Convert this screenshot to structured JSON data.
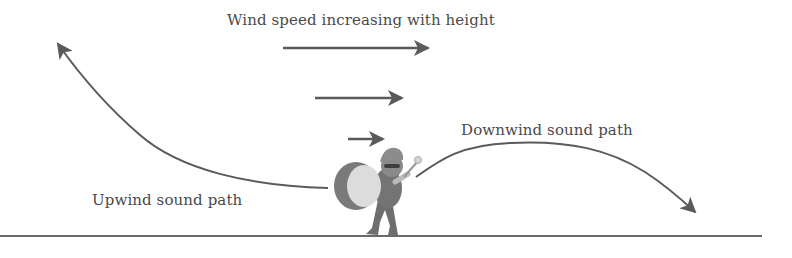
{
  "diagram": {
    "title": "Wind speed increasing with height",
    "labels": {
      "downwind": "Downwind sound path",
      "upwind": "Upwind sound path"
    },
    "wind_arrows": [
      {
        "name": "wind-arrow-high",
        "x1": 283,
        "x2": 430,
        "y": 48
      },
      {
        "name": "wind-arrow-mid",
        "x1": 315,
        "x2": 404,
        "y": 98
      },
      {
        "name": "wind-arrow-low",
        "x1": 348,
        "x2": 385,
        "y": 139
      }
    ],
    "source": "Drummer with bass drum",
    "colors": {
      "line": "#5a5a5a",
      "text": "#4a4a4a",
      "ground": "#6a6a6a",
      "drum_face": "#dcdcdc",
      "drum_shell": "#7a7a7a",
      "figure": "#6e6e6e"
    }
  }
}
